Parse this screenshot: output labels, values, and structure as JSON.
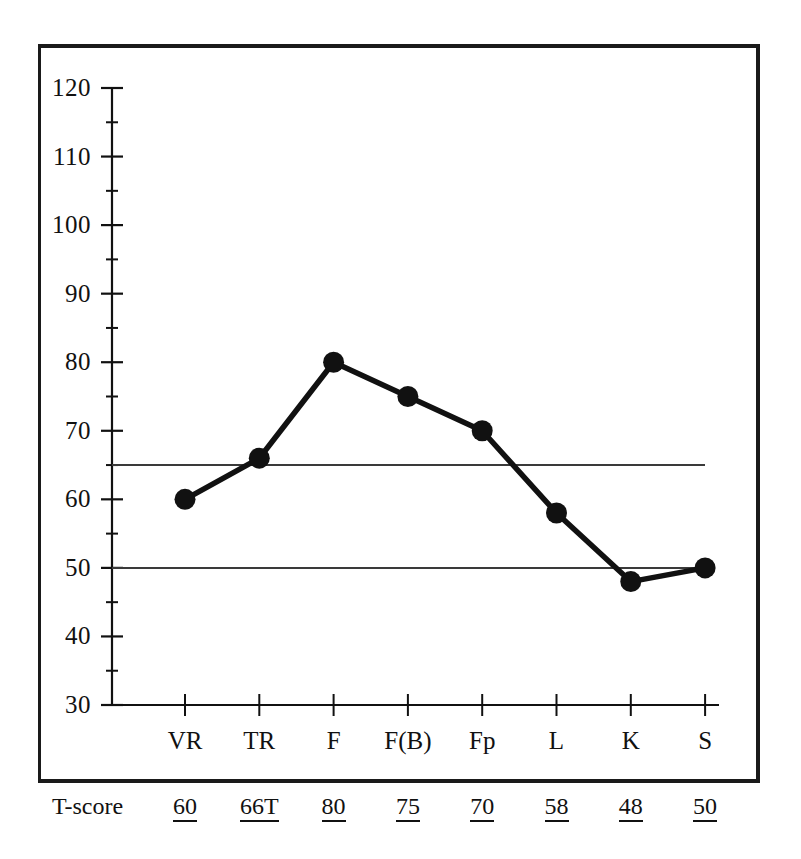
{
  "chart_data": {
    "type": "line",
    "title": "",
    "subtitle": "",
    "xlabel": "",
    "ylabel": "",
    "categories": [
      "VR",
      "TR",
      "F",
      "F(B)",
      "Fp",
      "L",
      "K",
      "S"
    ],
    "values": [
      60,
      66,
      80,
      75,
      70,
      58,
      48,
      50
    ],
    "ylim": [
      30,
      120
    ],
    "y_major_step": 10,
    "y_minor_step": 5,
    "y_ticks": [
      30,
      40,
      50,
      60,
      70,
      80,
      90,
      100,
      110,
      120
    ],
    "y_tick_labels": [
      "30",
      "40",
      "50",
      "60",
      "70",
      "80",
      "90",
      "100",
      "110",
      "120"
    ],
    "grid": false,
    "legend": "none",
    "series": [
      {
        "name": "T-score profile",
        "values": [
          60,
          66,
          80,
          75,
          70,
          58,
          48,
          50
        ],
        "color": "#111111",
        "marker": "filled-circle"
      }
    ],
    "reference_lines": [
      {
        "value": 65,
        "label": "",
        "color": "#3a3a3a"
      },
      {
        "value": 50,
        "label": "",
        "color": "#3a3a3a"
      }
    ],
    "annotations": []
  },
  "axis": {
    "y_labels": [
      "120",
      "110",
      "100",
      "90",
      "80",
      "70",
      "60",
      "50",
      "40",
      "30"
    ],
    "x_labels": [
      "VR",
      "TR",
      "F",
      "F(B)",
      "Fp",
      "L",
      "K",
      "S"
    ]
  },
  "tscore_row": {
    "caption": "T-score",
    "values": [
      "60",
      "66T",
      "80",
      "75",
      "70",
      "58",
      "48",
      "50"
    ]
  },
  "colors": {
    "ink": "#111111",
    "line": "#111111",
    "reference_line": "#3a3a3a",
    "frame": "#1a1a1a",
    "background": "#ffffff"
  }
}
